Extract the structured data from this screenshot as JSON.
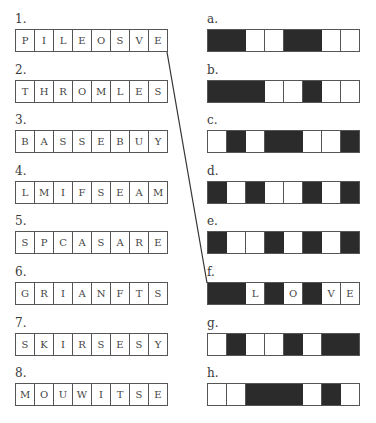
{
  "left": [
    {
      "label": "1.",
      "letters": [
        "P",
        "I",
        "L",
        "E",
        "O",
        "S",
        "V",
        "E"
      ]
    },
    {
      "label": "2.",
      "letters": [
        "T",
        "H",
        "R",
        "O",
        "M",
        "L",
        "E",
        "S"
      ]
    },
    {
      "label": "3.",
      "letters": [
        "B",
        "A",
        "S",
        "S",
        "E",
        "B",
        "U",
        "Y"
      ]
    },
    {
      "label": "4.",
      "letters": [
        "L",
        "M",
        "I",
        "F",
        "S",
        "E",
        "A",
        "M"
      ]
    },
    {
      "label": "5.",
      "letters": [
        "S",
        "P",
        "C",
        "A",
        "S",
        "A",
        "R",
        "E"
      ]
    },
    {
      "label": "6.",
      "letters": [
        "G",
        "R",
        "I",
        "A",
        "N",
        "F",
        "T",
        "S"
      ]
    },
    {
      "label": "7.",
      "letters": [
        "S",
        "K",
        "I",
        "R",
        "S",
        "E",
        "S",
        "Y"
      ]
    },
    {
      "label": "8.",
      "letters": [
        "M",
        "O",
        "U",
        "W",
        "I",
        "T",
        "S",
        "E"
      ]
    }
  ],
  "right": [
    {
      "label": "a.",
      "cells": [
        1,
        1,
        0,
        0,
        1,
        1,
        0,
        0
      ],
      "letters": [
        "",
        "",
        "",
        "",
        "",
        "",
        "",
        ""
      ]
    },
    {
      "label": "b.",
      "cells": [
        1,
        1,
        1,
        0,
        0,
        1,
        0,
        0
      ],
      "letters": [
        "",
        "",
        "",
        "",
        "",
        "",
        "",
        ""
      ]
    },
    {
      "label": "c.",
      "cells": [
        0,
        1,
        0,
        1,
        1,
        0,
        0,
        1
      ],
      "letters": [
        "",
        "",
        "",
        "",
        "",
        "",
        "",
        ""
      ]
    },
    {
      "label": "d.",
      "cells": [
        1,
        0,
        1,
        0,
        0,
        1,
        0,
        1
      ],
      "letters": [
        "",
        "",
        "",
        "",
        "",
        "",
        "",
        ""
      ]
    },
    {
      "label": "e.",
      "cells": [
        1,
        0,
        0,
        1,
        0,
        1,
        0,
        1
      ],
      "letters": [
        "",
        "",
        "",
        "",
        "",
        "",
        "",
        ""
      ]
    },
    {
      "label": "f.",
      "cells": [
        1,
        1,
        0,
        1,
        0,
        1,
        0,
        0
      ],
      "letters": [
        "",
        "",
        "L",
        "",
        "O",
        "",
        "V",
        "E"
      ]
    },
    {
      "label": "g.",
      "cells": [
        0,
        1,
        0,
        0,
        1,
        0,
        1,
        1
      ],
      "letters": [
        "",
        "",
        "",
        "",
        "",
        "",
        "",
        ""
      ]
    },
    {
      "label": "h.",
      "cells": [
        0,
        0,
        1,
        1,
        1,
        0,
        1,
        0
      ],
      "letters": [
        "",
        "",
        "",
        "",
        "",
        "",
        "",
        ""
      ]
    }
  ],
  "connector": {
    "from_row": 1,
    "to_row": "f"
  },
  "colors": {
    "dark_cell": "#2b2b2b",
    "border": "#555555",
    "text": "#3a3a3a"
  }
}
